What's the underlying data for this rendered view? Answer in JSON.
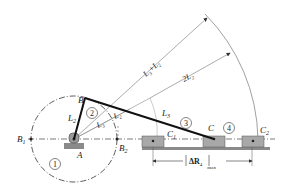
{
  "diagram": {
    "points": {
      "A": "A",
      "B": "B",
      "B1": "B",
      "B1_sub": "1",
      "B2": "B",
      "B2_sub": "2",
      "C": "C",
      "C1": "C",
      "C1_sub": "1",
      "C2": "C",
      "C2_sub": "2"
    },
    "links": {
      "link1": "1",
      "link2": "2",
      "link3": "3",
      "link4": "4"
    },
    "lengths": {
      "L2": "L",
      "L2_sub": "2",
      "L3": "L",
      "L3_sub": "3",
      "L3_minus_L2_a": "L",
      "L3_minus_L2_a_sub": "3",
      "L3_minus_L2_b": "L",
      "L3_minus_L2_b_sub": "2",
      "L3_plus_L2_a": "L",
      "L3_plus_L2_a_sub": "3",
      "plus": "+",
      "L3_plus_L2_b": "L",
      "L3_plus_L2_b_sub": "2",
      "twoL2": "2L",
      "twoL2_sub": "2"
    },
    "dimension": {
      "delta": "ΔR",
      "sub": "4",
      "max": "max"
    },
    "colors": {
      "line": "#222222",
      "thin": "#888888",
      "block_fill": "#a8a8a8",
      "ground": "#8a8a8a"
    }
  }
}
